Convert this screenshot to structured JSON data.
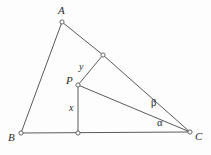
{
  "figure": {
    "kind": "euclidean-geometry-diagram",
    "width": 211,
    "height": 155,
    "background_color": "#fdfdfd",
    "stroke_color": "#5a5a5a",
    "text_color": "#2b2b2b",
    "vertex_marker": {
      "shape": "open-circle",
      "radius": 2.1,
      "fill": "#fdfdfd",
      "stroke": "#5a5a5a"
    }
  },
  "points": {
    "A": {
      "label": "A",
      "x": 62,
      "y": 22,
      "label_x": 58,
      "label_y": 5
    },
    "B": {
      "label": "B",
      "x": 21,
      "y": 133,
      "label_x": 8,
      "label_y": 132
    },
    "C": {
      "label": "C",
      "x": 190,
      "y": 132,
      "label_x": 195,
      "label_y": 131
    },
    "P": {
      "label": "P",
      "x": 78,
      "y": 85,
      "label_x": 66,
      "label_y": 75
    },
    "Q": {
      "label": "",
      "x": 103,
      "y": 55,
      "label_x": 0,
      "label_y": 0
    },
    "D": {
      "label": "",
      "x": 78,
      "y": 133,
      "label_x": 0,
      "label_y": 0
    }
  },
  "segments": [
    {
      "name": "side-ab",
      "from": "A",
      "to": "B"
    },
    {
      "name": "side-aq",
      "from": "A",
      "to": "Q"
    },
    {
      "name": "side-qc",
      "from": "Q",
      "to": "C"
    },
    {
      "name": "side-bc",
      "from": "B",
      "to": "C"
    },
    {
      "name": "segment-pd",
      "from": "P",
      "to": "D"
    },
    {
      "name": "segment-pq",
      "from": "P",
      "to": "Q"
    },
    {
      "name": "segment-pc",
      "from": "P",
      "to": "C"
    }
  ],
  "length_labels": [
    {
      "name": "length-x",
      "text": "x",
      "x": 69,
      "y": 103
    },
    {
      "name": "length-y",
      "text": "y",
      "x": 79,
      "y": 62
    }
  ],
  "angle_labels": [
    {
      "name": "angle-beta",
      "text": "β",
      "x": 151,
      "y": 98
    },
    {
      "name": "angle-alpha",
      "text": "α",
      "x": 157,
      "y": 118
    }
  ]
}
